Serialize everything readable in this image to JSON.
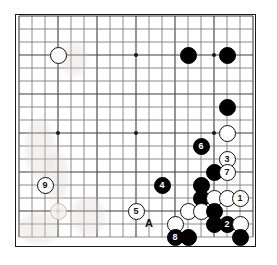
{
  "diagram": {
    "kind": "go-board-diagram",
    "board_size": 19,
    "visible_cols": 19,
    "visible_rows": 18,
    "grid_spacing_px": 13,
    "origin": {
      "x": 18,
      "y": 15
    },
    "colors": {
      "background": "#ffffff",
      "grid_line": "#6e6e6e",
      "grid_line_major": "#3c3c3c",
      "border": "#1a1a1a",
      "black_stone": "#000000",
      "white_stone": "#ffffff",
      "label_on_black": "#ffffff",
      "label_on_white": "#111111"
    },
    "star_points": [
      {
        "col": 3,
        "row": 3
      },
      {
        "col": 9,
        "row": 3
      },
      {
        "col": 15,
        "row": 3
      },
      {
        "col": 3,
        "row": 9
      },
      {
        "col": 9,
        "row": 9
      },
      {
        "col": 15,
        "row": 9
      },
      {
        "col": 3,
        "row": 15
      },
      {
        "col": 9,
        "row": 15
      },
      {
        "col": 15,
        "row": 15
      }
    ],
    "stones": [
      {
        "id": "w-top-left",
        "color": "white",
        "col": 3,
        "row": 3,
        "label": ""
      },
      {
        "id": "b-top-1",
        "color": "black",
        "col": 13,
        "row": 3,
        "label": ""
      },
      {
        "id": "b-top-2",
        "color": "black",
        "col": 16,
        "row": 3,
        "label": ""
      },
      {
        "id": "b-right-1",
        "color": "black",
        "col": 16,
        "row": 7,
        "label": ""
      },
      {
        "id": "w-right-1",
        "color": "white",
        "col": 16,
        "row": 9,
        "label": ""
      },
      {
        "id": "b-move-6",
        "color": "black",
        "col": 14,
        "row": 10,
        "label": "6"
      },
      {
        "id": "w-move-3",
        "color": "white",
        "col": 16,
        "row": 11,
        "label": "3"
      },
      {
        "id": "b-mid-1",
        "color": "black",
        "col": 15,
        "row": 12,
        "label": ""
      },
      {
        "id": "w-move-7",
        "color": "white",
        "col": 16,
        "row": 12,
        "label": "7"
      },
      {
        "id": "b-move-4",
        "color": "black",
        "col": 11,
        "row": 13,
        "label": "4"
      },
      {
        "id": "w-move-9",
        "color": "white",
        "col": 2,
        "row": 13,
        "label": "9"
      },
      {
        "id": "b-mid-2",
        "color": "black",
        "col": 14,
        "row": 13,
        "label": ""
      },
      {
        "id": "b-mid-3",
        "color": "black",
        "col": 14,
        "row": 14,
        "label": ""
      },
      {
        "id": "w-mid-1",
        "color": "white",
        "col": 15,
        "row": 14,
        "label": ""
      },
      {
        "id": "w-mid-2",
        "color": "white",
        "col": 16,
        "row": 14,
        "label": ""
      },
      {
        "id": "w-move-1",
        "color": "white",
        "col": 17,
        "row": 14,
        "label": "1"
      },
      {
        "id": "w-ghost-left",
        "color": "ghost",
        "col": 3,
        "row": 15,
        "label": ""
      },
      {
        "id": "w-move-5",
        "color": "white",
        "col": 9,
        "row": 15,
        "label": "5"
      },
      {
        "id": "w-mid-3",
        "color": "white",
        "col": 13,
        "row": 15,
        "label": ""
      },
      {
        "id": "w-mid-4",
        "color": "white",
        "col": 14,
        "row": 15,
        "label": ""
      },
      {
        "id": "b-mid-4",
        "color": "black",
        "col": 15,
        "row": 15,
        "label": ""
      },
      {
        "id": "w-low-1",
        "color": "white",
        "col": 12,
        "row": 16,
        "label": ""
      },
      {
        "id": "b-low-1",
        "color": "black",
        "col": 15,
        "row": 16,
        "label": ""
      },
      {
        "id": "b-move-2",
        "color": "black",
        "col": 16,
        "row": 16,
        "label": "2"
      },
      {
        "id": "w-low-2",
        "color": "white",
        "col": 17,
        "row": 16,
        "label": ""
      },
      {
        "id": "b-move-8",
        "color": "black",
        "col": 12,
        "row": 17,
        "label": "8"
      },
      {
        "id": "b-low-2",
        "color": "black",
        "col": 13,
        "row": 17,
        "label": ""
      },
      {
        "id": "b-low-3",
        "color": "black",
        "col": 17,
        "row": 17,
        "label": ""
      }
    ],
    "point_labels": [
      {
        "id": "point-a",
        "text": "A",
        "col": 10,
        "row": 16
      }
    ],
    "move_numbers": [
      "1",
      "2",
      "3",
      "4",
      "5",
      "6",
      "7",
      "8",
      "9"
    ],
    "smudges": [
      {
        "x": 24,
        "y": 118,
        "w": 30,
        "h": 60
      },
      {
        "x": 44,
        "y": 150,
        "w": 24,
        "h": 50
      },
      {
        "x": 18,
        "y": 210,
        "w": 40,
        "h": 34
      },
      {
        "x": 70,
        "y": 195,
        "w": 34,
        "h": 40
      },
      {
        "x": 60,
        "y": 40,
        "w": 26,
        "h": 36
      }
    ]
  }
}
